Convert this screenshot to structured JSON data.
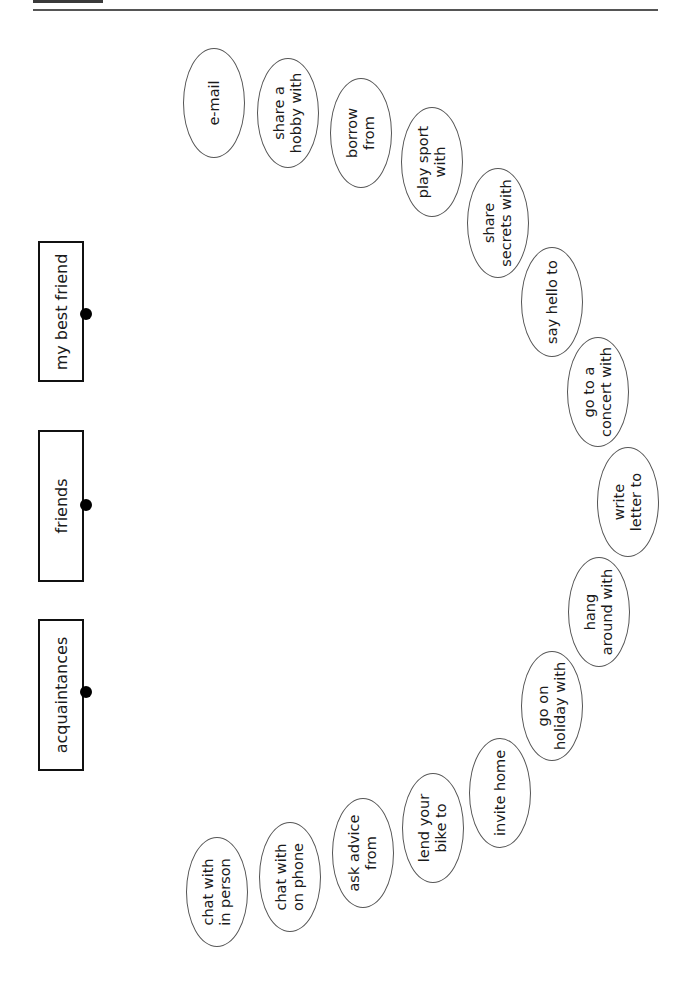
{
  "categories": [
    {
      "label": "my best friend",
      "top": 241,
      "height": 137,
      "dot_y": 308
    },
    {
      "label": "friends",
      "top": 430,
      "height": 148,
      "dot_y": 499
    },
    {
      "label": "acquaintances",
      "top": 619,
      "height": 148,
      "dot_y": 686
    }
  ],
  "activities": [
    {
      "label": "e-mail",
      "cx": 214,
      "cy": 103
    },
    {
      "label": "share a\nhobby with",
      "cx": 288,
      "cy": 113
    },
    {
      "label": "borrow\nfrom",
      "cx": 361,
      "cy": 133
    },
    {
      "label": "play sport\nwith",
      "cx": 432,
      "cy": 162
    },
    {
      "label": "share\nsecrets with",
      "cx": 498,
      "cy": 223
    },
    {
      "label": "say hello to",
      "cx": 552,
      "cy": 302
    },
    {
      "label": "go to a\nconcert with",
      "cx": 598,
      "cy": 392
    },
    {
      "label": "write\nletter to",
      "cx": 628,
      "cy": 502
    },
    {
      "label": "hang\naround with",
      "cx": 599,
      "cy": 612
    },
    {
      "label": "go on\nholiday with",
      "cx": 552,
      "cy": 706
    },
    {
      "label": "invite home",
      "cx": 500,
      "cy": 793
    },
    {
      "label": "lend your\nbike to",
      "cx": 433,
      "cy": 828
    },
    {
      "label": "ask advice\nfrom",
      "cx": 363,
      "cy": 853
    },
    {
      "label": "chat with\non phone",
      "cx": 290,
      "cy": 877
    },
    {
      "label": "chat with\nin person",
      "cx": 217,
      "cy": 892
    }
  ]
}
